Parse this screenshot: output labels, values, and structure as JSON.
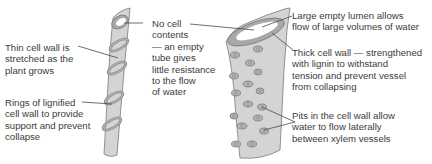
{
  "left_vessel": {
    "name": "Protoxylem vessel with rings",
    "labels": {
      "thin_wall": "Thin cell wall is\nstretched as the\nplant grows",
      "rings": "Rings of lignified\ncell wall to provide\nsupport and prevent\ncollapse"
    }
  },
  "middle": {
    "no_contents": "No cell\ncontents\n— an empty\ntube gives\nlittle resistance\nto the flow\nof water"
  },
  "right_vessel": {
    "name": "Metaxylem vessel with pits",
    "labels": {
      "lumen": "Large empty lumen allows\nflow of large volumes of water",
      "thick_wall": "Thick cell wall — strengthened\nwith lignin to withstand\ntension and prevent vessel\nfrom collapsing",
      "pits": "Pits in the cell wall allow\nwater to flow laterally\nbetween xylem vessels"
    }
  },
  "colors": {
    "vessel_fill": "#d4d4d4",
    "wall_fill": "#a8a8a8",
    "outline": "#7a7a7a",
    "lumen": "#ffffff",
    "leader_line": "#4a4a4a",
    "text": "#3c3c3c"
  }
}
